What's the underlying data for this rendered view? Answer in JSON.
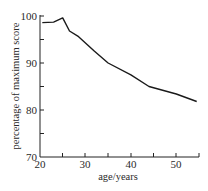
{
  "chart_data": {
    "type": "line",
    "title": "",
    "xlabel": "age/years",
    "ylabel": "percentage of maximum score",
    "xlim": [
      20,
      55
    ],
    "ylim": [
      70,
      100
    ],
    "x_ticks": [
      20,
      25,
      30,
      35,
      40,
      45,
      50,
      55
    ],
    "x_tick_labels": [
      "20",
      "30",
      "40",
      "50"
    ],
    "y_ticks": [
      70,
      75,
      80,
      85,
      90,
      95,
      100
    ],
    "y_tick_labels": [
      "70",
      "80",
      "90",
      "100"
    ],
    "grid": false,
    "legend": null,
    "series": [
      {
        "name": "score",
        "x": [
          20.5,
          23,
          25,
          26.5,
          28.5,
          32,
          35,
          40,
          44,
          50,
          54.5
        ],
        "y": [
          98.6,
          98.7,
          99.6,
          96.8,
          95.6,
          92.5,
          90,
          87.5,
          85,
          83.4,
          81.8
        ]
      }
    ]
  },
  "labels": {
    "xlabel": "age/years",
    "ylabel": "percentage of maximum score",
    "y100": "100",
    "y90": "90",
    "y80": "80",
    "y70": "70",
    "x20": "20",
    "x30": "30",
    "x40": "40",
    "x50": "50"
  }
}
